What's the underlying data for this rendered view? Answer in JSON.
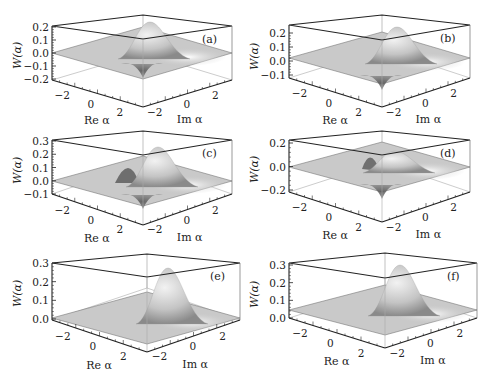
{
  "figure": {
    "ylabel": "W(α)",
    "xlabel_re": "Re α",
    "xlabel_im": "Im α"
  },
  "panels": [
    {
      "id": "a",
      "tag": "(a)",
      "yticks": [
        "0.2",
        "0.1",
        "0.0",
        "−0.1",
        "−0.2"
      ],
      "re_ticks": [
        "−2",
        "0",
        "2"
      ],
      "im_ticks": [
        "−2",
        "0",
        "2"
      ]
    },
    {
      "id": "b",
      "tag": "(b)",
      "yticks": [
        "0.2",
        "0.1",
        "0.0",
        "−0.1"
      ],
      "re_ticks": [
        "−2",
        "0",
        "2"
      ],
      "im_ticks": [
        "−2",
        "0",
        "2"
      ]
    },
    {
      "id": "c",
      "tag": "(c)",
      "yticks": [
        "0.3",
        "0.2",
        "0.1",
        "0.0",
        "−0.1"
      ],
      "re_ticks": [
        "−2",
        "0",
        "2"
      ],
      "im_ticks": [
        "−2",
        "0",
        "2"
      ]
    },
    {
      "id": "d",
      "tag": "(d)",
      "yticks": [
        "0.2",
        "0.0",
        "−0.2"
      ],
      "re_ticks": [
        "−2",
        "0",
        "2"
      ],
      "im_ticks": [
        "−2",
        "0",
        "2"
      ]
    },
    {
      "id": "e",
      "tag": "(e)",
      "yticks": [
        "0.3",
        "0.2",
        "0.1",
        "0.0"
      ],
      "re_ticks": [
        "−2",
        "0",
        "2"
      ],
      "im_ticks": [
        "−2",
        "0",
        "2"
      ]
    },
    {
      "id": "f",
      "tag": "(f)",
      "yticks": [
        "0.3",
        "0.2",
        "0.1",
        "0.0"
      ],
      "re_ticks": [
        "−2",
        "0",
        "2"
      ],
      "im_ticks": [
        "−2",
        "0",
        "2"
      ]
    }
  ],
  "chart_data": [
    {
      "type": "surface3d",
      "title": "(a)",
      "xlabel": "Re α",
      "ylabel": "Im α",
      "zlabel": "W(α)",
      "xlim": [
        -3,
        3
      ],
      "ylim": [
        -3,
        3
      ],
      "zlim": [
        -0.2,
        0.25
      ],
      "zticks": [
        -0.2,
        -0.1,
        0.0,
        0.1,
        0.2
      ],
      "features": {
        "peak": 0.22,
        "min": -0.05,
        "description": "Wigner function with a positive peak near center and small negative region"
      }
    },
    {
      "type": "surface3d",
      "title": "(b)",
      "xlabel": "Re α",
      "ylabel": "Im α",
      "zlabel": "W(α)",
      "xlim": [
        -3,
        3
      ],
      "ylim": [
        -3,
        3
      ],
      "zlim": [
        -0.15,
        0.28
      ],
      "zticks": [
        -0.1,
        0.0,
        0.1,
        0.2
      ],
      "features": {
        "peak": 0.25,
        "min": -0.12,
        "description": "Positive peak with pronounced negative dip near origin"
      }
    },
    {
      "type": "surface3d",
      "title": "(c)",
      "xlabel": "Re α",
      "ylabel": "Im α",
      "zlabel": "W(α)",
      "xlim": [
        -3,
        3
      ],
      "ylim": [
        -3,
        3
      ],
      "zlim": [
        -0.1,
        0.3
      ],
      "zticks": [
        -0.1,
        0.0,
        0.1,
        0.2,
        0.3
      ],
      "features": {
        "peak": 0.28,
        "secondary_peak": 0.12,
        "min": -0.05,
        "description": "Two positive lobes with interference region"
      }
    },
    {
      "type": "surface3d",
      "title": "(d)",
      "xlabel": "Re α",
      "ylabel": "Im α",
      "zlabel": "W(α)",
      "xlim": [
        -3,
        3
      ],
      "ylim": [
        -3,
        3
      ],
      "zlim": [
        -0.22,
        0.22
      ],
      "zticks": [
        -0.2,
        0.0,
        0.2
      ],
      "features": {
        "peak": 0.15,
        "min": -0.2,
        "description": "Strong negative dip at origin with surrounding positive ridges"
      }
    },
    {
      "type": "surface3d",
      "title": "(e)",
      "xlabel": "Re α",
      "ylabel": "Im α",
      "zlabel": "W(α)",
      "xlim": [
        -3,
        3
      ],
      "ylim": [
        -3,
        3
      ],
      "zlim": [
        -0.01,
        0.33
      ],
      "zticks": [
        0.0,
        0.1,
        0.2,
        0.3
      ],
      "features": {
        "peak": 0.32,
        "min": 0.0,
        "description": "Single Gaussian-like positive peak"
      }
    },
    {
      "type": "surface3d",
      "title": "(f)",
      "xlabel": "Re α",
      "ylabel": "Im α",
      "zlabel": "W(α)",
      "xlim": [
        -3,
        3
      ],
      "ylim": [
        -3,
        3
      ],
      "zlim": [
        -0.01,
        0.32
      ],
      "zticks": [
        0.0,
        0.1,
        0.2,
        0.3
      ],
      "features": {
        "peak": 0.31,
        "min": 0.0,
        "description": "Single Gaussian-like positive peak"
      }
    }
  ]
}
